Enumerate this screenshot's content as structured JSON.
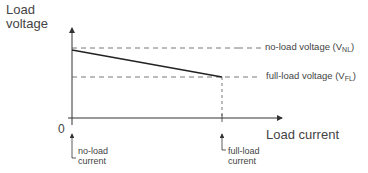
{
  "diagram": {
    "y_axis_label_line1": "Load",
    "y_axis_label_line2": "voltage",
    "x_axis_label": "Load current",
    "origin_label": "0",
    "no_load_voltage_text": "no-load voltage (V",
    "no_load_voltage_sub": "NL",
    "no_load_voltage_close": ")",
    "full_load_voltage_text": "full-load voltage (V",
    "full_load_voltage_sub": "FL",
    "full_load_voltage_close": ")",
    "no_load_current_line1": "no-load",
    "no_load_current_line2": "current",
    "full_load_current_line1": "full-load",
    "full_load_current_line2": "current"
  },
  "colors": {
    "line": "#222222",
    "dashed": "#555555",
    "text": "#444444"
  }
}
